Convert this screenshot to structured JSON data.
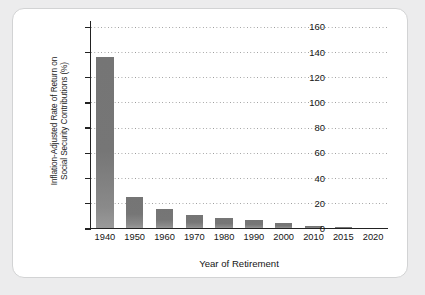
{
  "chart_data": {
    "type": "bar",
    "title": "",
    "xlabel": "Year of Retirement",
    "ylabel_lines": [
      "Inflation-Adjusted Rate of Return on",
      "Social Security Contributions (%)"
    ],
    "ylabel": "Inflation-Adjusted Rate of Return on Social Security Contributions (%)",
    "categories": [
      "1940",
      "1950",
      "1960",
      "1970",
      "1980",
      "1990",
      "2000",
      "2010",
      "2015",
      "2020"
    ],
    "values": [
      135,
      24,
      15,
      10,
      8,
      6,
      4,
      1.5,
      0.5,
      0.2
    ],
    "ylim": [
      0,
      165
    ],
    "yticks": [
      0,
      20,
      40,
      60,
      80,
      100,
      120,
      140,
      160
    ],
    "ytick_labels": [
      "0",
      "20",
      "40",
      "60",
      "80",
      "100",
      "120",
      "140",
      "160"
    ],
    "grid": true,
    "grid_axis": "y",
    "grid_style": "dotted",
    "legend": false,
    "bar_color": "#7a7a7a",
    "axis_color": "#222222",
    "gridline_color": "#9a9a9a",
    "plot_background": "#ffffff",
    "page_background": "#ececed"
  },
  "tick_labels": {
    "y": [
      "160",
      "140",
      "120",
      "100",
      "80",
      "60",
      "40",
      "20",
      "0"
    ],
    "x": [
      "1940",
      "1950",
      "1960",
      "1970",
      "1980",
      "1990",
      "2000",
      "2010",
      "2015",
      "2020"
    ]
  },
  "axis_titles": {
    "x": "Year of Retirement",
    "y_line1": "Inflation-Adjusted Rate of Return on",
    "y_line2": "Social Security Contributions (%)"
  }
}
